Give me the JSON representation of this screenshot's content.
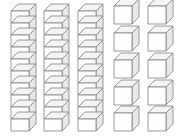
{
  "scene": {
    "title": "Base Ten Blocks",
    "description": "Three rods of ten unit cubes and ten single unit cubes",
    "background_color": "#ffffff",
    "edge_color": "#808080",
    "front_face_color": "#fefefe",
    "top_face_color": "#f4f4f4",
    "side_face_color": "#e8e8e8"
  },
  "geometry": {
    "cell_width": 18,
    "cell_height": 12,
    "depth_x": 7,
    "depth_y": 7
  },
  "rods": [
    {
      "name": "rod-1",
      "origin_x": 11,
      "origin_y": 131,
      "units": 10
    },
    {
      "name": "rod-2",
      "origin_x": 44,
      "origin_y": 131,
      "units": 10
    },
    {
      "name": "rod-3",
      "origin_x": 78,
      "origin_y": 131,
      "units": 10
    }
  ],
  "unit_cubes": [
    {
      "name": "unit-cube-1",
      "origin_x": 114,
      "origin_y": 24
    },
    {
      "name": "unit-cube-2",
      "origin_x": 148,
      "origin_y": 24
    },
    {
      "name": "unit-cube-3",
      "origin_x": 114,
      "origin_y": 51
    },
    {
      "name": "unit-cube-4",
      "origin_x": 148,
      "origin_y": 51
    },
    {
      "name": "unit-cube-5",
      "origin_x": 114,
      "origin_y": 78
    },
    {
      "name": "unit-cube-6",
      "origin_x": 148,
      "origin_y": 78
    },
    {
      "name": "unit-cube-7",
      "origin_x": 114,
      "origin_y": 105
    },
    {
      "name": "unit-cube-8",
      "origin_x": 148,
      "origin_y": 105
    },
    {
      "name": "unit-cube-9",
      "origin_x": 114,
      "origin_y": 131
    },
    {
      "name": "unit-cube-10",
      "origin_x": 148,
      "origin_y": 131
    }
  ],
  "counts": {
    "rod_count": 3,
    "units_per_rod": 10,
    "loose_cube_count": 10,
    "total_units": 40
  }
}
